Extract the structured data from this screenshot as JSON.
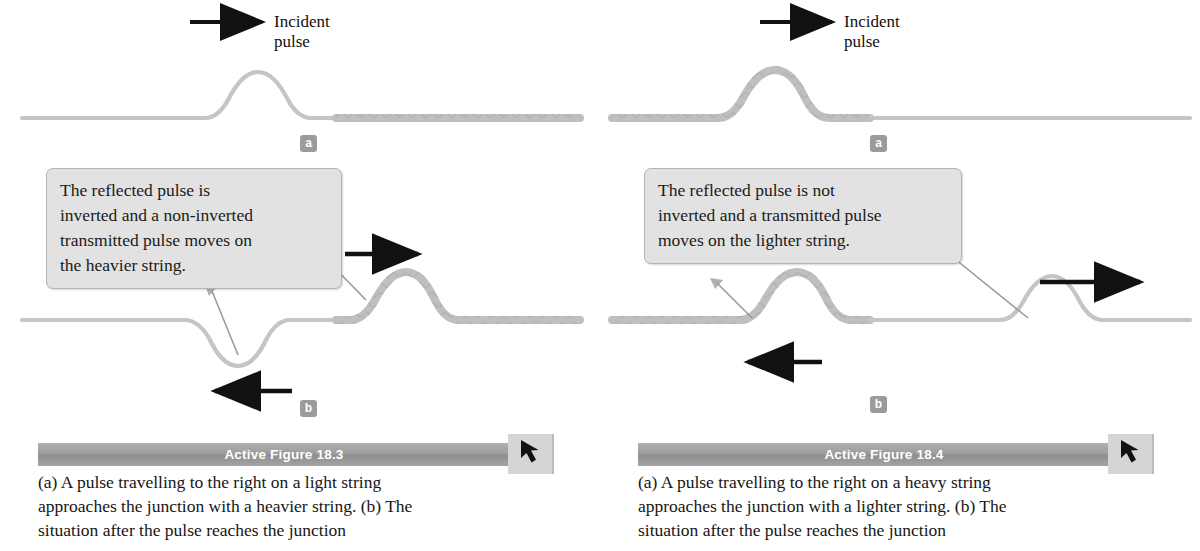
{
  "figures": [
    {
      "id": "active-figure-18-3",
      "banner_title": "Active Figure 18.3",
      "caption": "(a) A pulse travelling to the right on a light string\napproaches the junction with a heavier string. (b) The\nsituation after the pulse reaches the junction",
      "incident_label": "Incident\npulse",
      "panel_a_badge": "a",
      "panel_b_badge": "b",
      "callout": "The reflected pulse is\ninverted and a non-inverted\ntransmitted pulse moves on\nthe heavier string.",
      "tab_icon": "arrow-cursor-icon",
      "strings": {
        "incoming": "light",
        "outgoing": "heavy"
      },
      "arrows": {
        "incident_direction": "right",
        "reflected_direction": "left",
        "transmitted_direction": "right"
      },
      "reflected_pulse_inverted": true
    },
    {
      "id": "active-figure-18-4",
      "banner_title": "Active Figure 18.4",
      "caption": "(a) A pulse travelling to the right on a heavy string\napproaches the junction with a lighter string. (b) The\nsituation after the pulse reaches the junction",
      "incident_label": "Incident\npulse",
      "panel_a_badge": "a",
      "panel_b_badge": "b",
      "callout": "The reflected pulse is not\ninverted and a transmitted pulse\nmoves on the lighter string.",
      "tab_icon": "arrow-cursor-icon",
      "strings": {
        "incoming": "heavy",
        "outgoing": "light"
      },
      "arrows": {
        "incident_direction": "right",
        "reflected_direction": "left",
        "transmitted_direction": "right"
      },
      "reflected_pulse_inverted": false
    }
  ],
  "colors": {
    "string": "#bdbdbd",
    "string_dark": "#a8a8a8",
    "badge_bg": "#9b9b9b",
    "callout_bg": "#e2e2e2",
    "callout_border": "#b4b4b4",
    "banner_bg": "#9d9d9d",
    "banner_text": "#ffffff",
    "tab_bg": "#d5d5d5",
    "arrow": "#111111",
    "text": "#1a1a1a"
  }
}
